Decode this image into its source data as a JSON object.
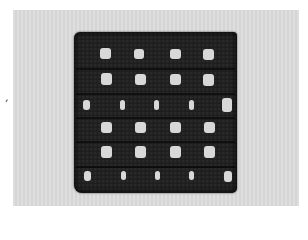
{
  "image": {
    "subject": "crochet filet mesh swatch",
    "colors": {
      "background_border": "#ffffff",
      "backdrop": "#dcdcdc",
      "yarn": "#1e1e1e",
      "holes": "#d8d8d8"
    },
    "grid": {
      "rows": [
        {
          "type": "open",
          "holes": [
            [
              100,
              48,
              11,
              11
            ],
            [
              134,
              49,
              10,
              10
            ],
            [
              170,
              49,
              11,
              10
            ],
            [
              203,
              49,
              11,
              11
            ]
          ]
        },
        {
          "type": "open",
          "holes": [
            [
              101,
              73,
              11,
              12
            ],
            [
              135,
              74,
              11,
              11
            ],
            [
              170,
              74,
              11,
              11
            ],
            [
              203,
              74,
              11,
              12
            ]
          ]
        },
        {
          "type": "slit",
          "holes": [
            [
              83,
              100,
              7,
              10
            ],
            [
              120,
              100,
              5,
              10
            ],
            [
              154,
              100,
              5,
              10
            ],
            [
              189,
              100,
              5,
              10
            ],
            [
              222,
              98,
              10,
              14
            ]
          ]
        },
        {
          "type": "open",
          "holes": [
            [
              101,
              122,
              11,
              11
            ],
            [
              135,
              122,
              11,
              11
            ],
            [
              170,
              122,
              11,
              11
            ],
            [
              204,
              122,
              11,
              11
            ]
          ]
        },
        {
          "type": "open",
          "holes": [
            [
              101,
              146,
              11,
              12
            ],
            [
              135,
              146,
              11,
              12
            ],
            [
              170,
              146,
              11,
              12
            ],
            [
              204,
              146,
              11,
              12
            ]
          ]
        },
        {
          "type": "slit",
          "holes": [
            [
              84,
              171,
              7,
              10
            ],
            [
              121,
              171,
              5,
              9
            ],
            [
              155,
              171,
              5,
              9
            ],
            [
              189,
              171,
              5,
              9
            ],
            [
              224,
              171,
              8,
              11
            ]
          ]
        }
      ]
    }
  }
}
